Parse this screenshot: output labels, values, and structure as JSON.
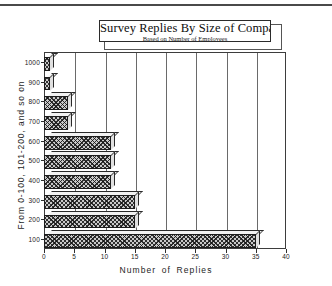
{
  "chart_data": {
    "type": "bar",
    "orientation": "horizontal",
    "title": "Survey Replies By Size of Company",
    "subtitle": "Based on Number of Employees",
    "xlabel": "Number of Replies",
    "ylabel": "From 0-100, 101-200, and so on",
    "categories": [
      "100",
      "200",
      "300",
      "400",
      "500",
      "600",
      "700",
      "800",
      "900",
      "1000"
    ],
    "values": [
      35,
      15,
      15,
      11,
      11,
      11,
      4,
      4,
      1,
      1
    ],
    "xlim": [
      0,
      40
    ],
    "xticks": [
      "0",
      "5",
      "10",
      "15",
      "20",
      "25",
      "30",
      "35",
      "40"
    ],
    "xtick_values": [
      0,
      5,
      10,
      15,
      20,
      25,
      30,
      35,
      40
    ],
    "yticks": [
      "100",
      "200",
      "300",
      "400",
      "500",
      "600",
      "700",
      "800",
      "900",
      "1000"
    ],
    "grid": "vertical",
    "legend": "none",
    "bar_style": "cross-hatched 3D",
    "colors": {
      "bar_fill": "#c9c9c9",
      "bar_outline": "#1c1c1c",
      "axis": "#3d3d3d",
      "gridline": "#6a6a6a",
      "background": "#ffffff",
      "text": "#1e1e1e"
    }
  }
}
